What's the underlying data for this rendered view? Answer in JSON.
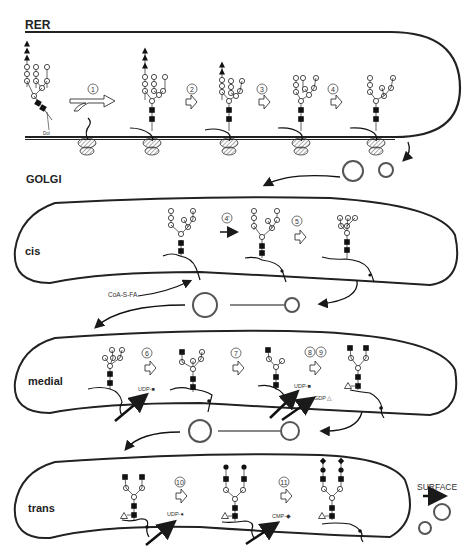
{
  "labels": {
    "rer": "RER",
    "golgi": "GOLGI",
    "cis": "cis",
    "medial": "medial",
    "trans": "trans",
    "surface": "SURFACE"
  },
  "annotations": {
    "dol": "Dol",
    "coa_s_fa": "CoA-S-FA",
    "udp_glcnac_medial_1": "UDP-■",
    "udp_glcnac_medial_2": "UDP-■",
    "gdp_fuc": "GDP △",
    "udp_gal": "UDP-●",
    "cmp_sia": "CMP-◆"
  },
  "steps": {
    "s1": "1",
    "s2": "2",
    "s3": "3",
    "s4": "4",
    "s4p": "4'",
    "s5": "5",
    "s6": "6",
    "s7": "7",
    "s8": "8",
    "s9": "9",
    "s10": "10",
    "s11": "11"
  },
  "legend_symbols": {
    "glucose": "filled-triangle",
    "mannose": "open-circle",
    "glcnac": "filled-square",
    "fucose": "open-triangle",
    "galactose": "filled-circle",
    "sialic_acid": "filled-diamond"
  },
  "colors": {
    "ink": "#1a1a1a",
    "background": "#ffffff",
    "ribosome_hatch": "#888888"
  }
}
